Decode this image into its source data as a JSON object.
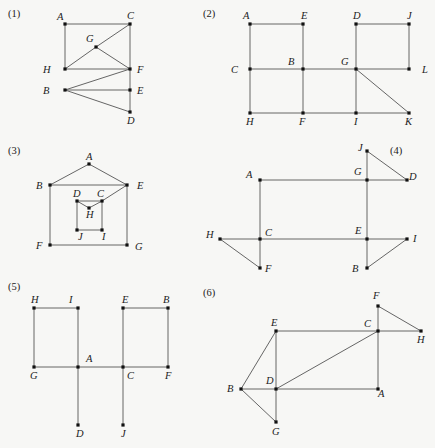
{
  "graphs": [
    {
      "id": "1",
      "label": "(1)",
      "label_pos": [
        8,
        17
      ],
      "nodes": [
        {
          "name": "A",
          "x": 65,
          "y": 24,
          "lx": -8,
          "ly": -4
        },
        {
          "name": "C",
          "x": 130,
          "y": 24,
          "lx": -3,
          "ly": -5
        },
        {
          "name": "G",
          "x": 96,
          "y": 47,
          "lx": -10,
          "ly": -5
        },
        {
          "name": "H",
          "x": 65,
          "y": 69,
          "lx": -22,
          "ly": 4
        },
        {
          "name": "F",
          "x": 130,
          "y": 69,
          "lx": 7,
          "ly": 4
        },
        {
          "name": "B",
          "x": 65,
          "y": 90,
          "lx": -22,
          "ly": 4
        },
        {
          "name": "E",
          "x": 130,
          "y": 90,
          "lx": 7,
          "ly": 4
        },
        {
          "name": "D",
          "x": 130,
          "y": 112,
          "lx": -3,
          "ly": 12
        }
      ],
      "edges": [
        [
          "A",
          "C"
        ],
        [
          "A",
          "H"
        ],
        [
          "H",
          "F"
        ],
        [
          "H",
          "G"
        ],
        [
          "G",
          "C"
        ],
        [
          "G",
          "F"
        ],
        [
          "C",
          "F"
        ],
        [
          "F",
          "E"
        ],
        [
          "E",
          "D"
        ],
        [
          "B",
          "F"
        ],
        [
          "B",
          "E"
        ],
        [
          "B",
          "D"
        ]
      ]
    },
    {
      "id": "2",
      "label": "(2)",
      "label_pos": [
        203,
        17
      ],
      "nodes": [
        {
          "name": "A",
          "x": 250,
          "y": 24,
          "lx": -7,
          "ly": -5
        },
        {
          "name": "E",
          "x": 303,
          "y": 24,
          "lx": -2,
          "ly": -5
        },
        {
          "name": "D",
          "x": 356,
          "y": 24,
          "lx": -3,
          "ly": -5
        },
        {
          "name": "J",
          "x": 409,
          "y": 24,
          "lx": -2,
          "ly": -5
        },
        {
          "name": "C",
          "x": 250,
          "y": 69,
          "lx": -19,
          "ly": 4
        },
        {
          "name": "B",
          "x": 303,
          "y": 69,
          "lx": -15,
          "ly": -4
        },
        {
          "name": "G",
          "x": 356,
          "y": 69,
          "lx": -15,
          "ly": -4
        },
        {
          "name": "L",
          "x": 409,
          "y": 69,
          "lx": 13,
          "ly": 4
        },
        {
          "name": "H",
          "x": 250,
          "y": 113,
          "lx": -4,
          "ly": 12
        },
        {
          "name": "F",
          "x": 303,
          "y": 113,
          "lx": -4,
          "ly": 12
        },
        {
          "name": "I",
          "x": 356,
          "y": 113,
          "lx": -2,
          "ly": 12
        },
        {
          "name": "K",
          "x": 409,
          "y": 113,
          "lx": -4,
          "ly": 12
        }
      ],
      "edges": [
        [
          "A",
          "E"
        ],
        [
          "A",
          "C"
        ],
        [
          "E",
          "B"
        ],
        [
          "C",
          "B"
        ],
        [
          "B",
          "G"
        ],
        [
          "G",
          "L"
        ],
        [
          "C",
          "H"
        ],
        [
          "B",
          "F"
        ],
        [
          "H",
          "F"
        ],
        [
          "F",
          "I"
        ],
        [
          "I",
          "K"
        ],
        [
          "D",
          "J"
        ],
        [
          "J",
          "L"
        ],
        [
          "D",
          "G"
        ],
        [
          "G",
          "I"
        ],
        [
          "G",
          "K"
        ]
      ]
    },
    {
      "id": "3",
      "label": "(3)",
      "label_pos": [
        8,
        154
      ],
      "nodes": [
        {
          "name": "A",
          "x": 89,
          "y": 164,
          "lx": -3,
          "ly": -4
        },
        {
          "name": "B",
          "x": 50,
          "y": 185,
          "lx": -14,
          "ly": 4
        },
        {
          "name": "E",
          "x": 127,
          "y": 185,
          "lx": 10,
          "ly": 4
        },
        {
          "name": "D",
          "x": 77,
          "y": 201,
          "lx": -4,
          "ly": -4
        },
        {
          "name": "C",
          "x": 102,
          "y": 201,
          "lx": -5,
          "ly": -4
        },
        {
          "name": "H",
          "x": 89,
          "y": 208,
          "lx": -3,
          "ly": 10
        },
        {
          "name": "J",
          "x": 77,
          "y": 230,
          "lx": 1,
          "ly": 10
        },
        {
          "name": "I",
          "x": 102,
          "y": 230,
          "lx": 0,
          "ly": 10
        },
        {
          "name": "F",
          "x": 50,
          "y": 245,
          "lx": -14,
          "ly": 4
        },
        {
          "name": "G",
          "x": 127,
          "y": 245,
          "lx": 8,
          "ly": 5
        }
      ],
      "edges": [
        [
          "A",
          "B"
        ],
        [
          "A",
          "E"
        ],
        [
          "B",
          "E"
        ],
        [
          "B",
          "F"
        ],
        [
          "E",
          "G"
        ],
        [
          "F",
          "G"
        ],
        [
          "E",
          "C"
        ],
        [
          "D",
          "C"
        ],
        [
          "D",
          "H"
        ],
        [
          "H",
          "C"
        ],
        [
          "D",
          "J"
        ],
        [
          "C",
          "I"
        ],
        [
          "J",
          "I"
        ]
      ]
    },
    {
      "id": "4",
      "label": "(4)",
      "label_pos": [
        390,
        154
      ],
      "nodes": [
        {
          "name": "J",
          "x": 367,
          "y": 151,
          "lx": -9,
          "ly": 0
        },
        {
          "name": "G",
          "x": 367,
          "y": 180,
          "lx": -13,
          "ly": -5
        },
        {
          "name": "D",
          "x": 407,
          "y": 180,
          "lx": 2,
          "ly": 0
        },
        {
          "name": "A",
          "x": 260,
          "y": 180,
          "lx": -14,
          "ly": -2
        },
        {
          "name": "H",
          "x": 220,
          "y": 239,
          "lx": -14,
          "ly": -1
        },
        {
          "name": "C",
          "x": 260,
          "y": 239,
          "lx": 5,
          "ly": -3
        },
        {
          "name": "E",
          "x": 367,
          "y": 239,
          "lx": -12,
          "ly": -5
        },
        {
          "name": "I",
          "x": 407,
          "y": 239,
          "lx": 6,
          "ly": 3
        },
        {
          "name": "F",
          "x": 260,
          "y": 268,
          "lx": 5,
          "ly": 4
        },
        {
          "name": "B",
          "x": 367,
          "y": 268,
          "lx": -15,
          "ly": 4
        }
      ],
      "edges": [
        [
          "A",
          "G"
        ],
        [
          "G",
          "D"
        ],
        [
          "J",
          "D"
        ],
        [
          "J",
          "G"
        ],
        [
          "G",
          "E"
        ],
        [
          "A",
          "C"
        ],
        [
          "H",
          "C"
        ],
        [
          "C",
          "E"
        ],
        [
          "E",
          "I"
        ],
        [
          "H",
          "F"
        ],
        [
          "C",
          "F"
        ],
        [
          "E",
          "B"
        ],
        [
          "B",
          "I"
        ]
      ]
    },
    {
      "id": "5",
      "label": "(5)",
      "label_pos": [
        8,
        290
      ],
      "nodes": [
        {
          "name": "H",
          "x": 34,
          "y": 308,
          "lx": -3,
          "ly": -5
        },
        {
          "name": "I",
          "x": 78,
          "y": 308,
          "lx": -9,
          "ly": -5
        },
        {
          "name": "E",
          "x": 123,
          "y": 308,
          "lx": -1,
          "ly": -5
        },
        {
          "name": "B",
          "x": 168,
          "y": 308,
          "lx": -5,
          "ly": -5
        },
        {
          "name": "G",
          "x": 34,
          "y": 367,
          "lx": -4,
          "ly": 12
        },
        {
          "name": "A",
          "x": 78,
          "y": 367,
          "lx": 8,
          "ly": -5
        },
        {
          "name": "C",
          "x": 123,
          "y": 367,
          "lx": 4,
          "ly": 12
        },
        {
          "name": "F",
          "x": 168,
          "y": 367,
          "lx": -3,
          "ly": 12
        },
        {
          "name": "D",
          "x": 78,
          "y": 425,
          "lx": -2,
          "ly": 12
        },
        {
          "name": "J",
          "x": 123,
          "y": 425,
          "lx": -2,
          "ly": 12
        }
      ],
      "edges": [
        [
          "H",
          "I"
        ],
        [
          "H",
          "G"
        ],
        [
          "I",
          "A"
        ],
        [
          "G",
          "A"
        ],
        [
          "A",
          "C"
        ],
        [
          "C",
          "F"
        ],
        [
          "E",
          "B"
        ],
        [
          "E",
          "C"
        ],
        [
          "B",
          "F"
        ],
        [
          "A",
          "D"
        ],
        [
          "C",
          "J"
        ]
      ]
    },
    {
      "id": "6",
      "label": "(6)",
      "label_pos": [
        203,
        296
      ],
      "nodes": [
        {
          "name": "F",
          "x": 378,
          "y": 306,
          "lx": -5,
          "ly": -7
        },
        {
          "name": "E",
          "x": 276,
          "y": 331,
          "lx": -5,
          "ly": -5
        },
        {
          "name": "C",
          "x": 378,
          "y": 331,
          "lx": -14,
          "ly": -4
        },
        {
          "name": "H",
          "x": 421,
          "y": 331,
          "lx": -4,
          "ly": 12
        },
        {
          "name": "B",
          "x": 241,
          "y": 389,
          "lx": -14,
          "ly": 3
        },
        {
          "name": "D",
          "x": 276,
          "y": 389,
          "lx": -10,
          "ly": -5
        },
        {
          "name": "A",
          "x": 378,
          "y": 389,
          "lx": 0,
          "ly": 8
        },
        {
          "name": "G",
          "x": 276,
          "y": 422,
          "lx": -4,
          "ly": 13
        }
      ],
      "edges": [
        [
          "F",
          "H"
        ],
        [
          "F",
          "C"
        ],
        [
          "E",
          "C"
        ],
        [
          "C",
          "H"
        ],
        [
          "E",
          "B"
        ],
        [
          "E",
          "D"
        ],
        [
          "D",
          "C"
        ],
        [
          "C",
          "A"
        ],
        [
          "B",
          "D"
        ],
        [
          "D",
          "A"
        ],
        [
          "B",
          "G"
        ],
        [
          "D",
          "G"
        ]
      ]
    }
  ]
}
